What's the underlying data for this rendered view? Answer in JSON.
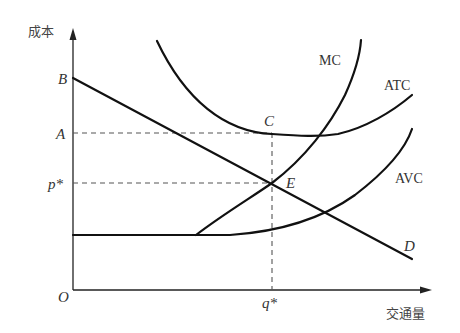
{
  "diagram": {
    "type": "cost-curves",
    "axes": {
      "y_label": "成本",
      "x_label": "交通量",
      "origin_label": "O"
    },
    "y_ticks": [
      {
        "label": "B",
        "y": 78
      },
      {
        "label": "A",
        "y": 133
      },
      {
        "label": "p*",
        "y": 183
      }
    ],
    "x_ticks": [
      {
        "label": "q*",
        "x": 272
      }
    ],
    "curves": [
      {
        "name": "MC",
        "label": "MC"
      },
      {
        "name": "ATC",
        "label": "ATC"
      },
      {
        "name": "AVC",
        "label": "AVC"
      },
      {
        "name": "D",
        "label": "D"
      }
    ],
    "points": [
      {
        "label": "C",
        "x": 272,
        "y": 133
      },
      {
        "label": "E",
        "x": 272,
        "y": 183
      }
    ],
    "colors": {
      "curve": "#111111",
      "axis": "#222222",
      "dashed": "#555555",
      "text": "#333333"
    }
  }
}
